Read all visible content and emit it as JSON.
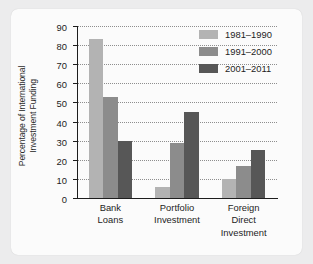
{
  "chart_data": {
    "type": "bar",
    "title": "",
    "xlabel": "",
    "ylabel": "Percentage of International Investment Funding",
    "ylabel_line1": "Percentage of International",
    "ylabel_line2": "Investment Funding",
    "categories": [
      "Bank Loans",
      "Portfolio Investment",
      "Foreign Direct Investment"
    ],
    "category_lines": [
      [
        "Bank",
        "Loans"
      ],
      [
        "Portfolio",
        "Investment"
      ],
      [
        "Foreign",
        "Direct",
        "Investment"
      ]
    ],
    "series": [
      {
        "name": "1981–1990",
        "color": "#b3b3b3",
        "values": [
          83,
          6,
          10
        ]
      },
      {
        "name": "1991–2000",
        "color": "#8c8c8c",
        "values": [
          53,
          29,
          17
        ]
      },
      {
        "name": "2001–2011",
        "color": "#575757",
        "values": [
          30,
          45,
          25
        ]
      }
    ],
    "ylim": [
      0,
      90
    ],
    "ytick_labels": [
      "0",
      "10",
      "20",
      "30",
      "40",
      "50",
      "60",
      "70",
      "80",
      "90"
    ],
    "ytick_values": [
      0,
      10,
      20,
      30,
      40,
      50,
      60,
      70,
      80,
      90
    ],
    "grid": true,
    "grid_style": "dotted",
    "legend_position": "top-right"
  },
  "colors": {
    "page_background": "#ececed",
    "card_background": "#fbfbfb",
    "axis": "#1d1d1d",
    "grid": "#8e8e8e",
    "text": "#1d1d1d"
  }
}
